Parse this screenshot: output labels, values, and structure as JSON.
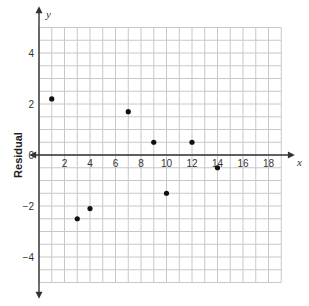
{
  "chart_data": {
    "type": "scatter",
    "title": "",
    "xlabel": "x",
    "ylabel": "Residual",
    "y_axis_letter": "y",
    "xlim": [
      0,
      20
    ],
    "ylim": [
      -5.5,
      5
    ],
    "grid": true,
    "grid_step_x": 1,
    "grid_step_y": 0.5,
    "x_ticks": [
      2,
      4,
      6,
      8,
      10,
      12,
      14,
      16,
      18
    ],
    "y_ticks": [
      4,
      2,
      0,
      -2,
      -4
    ],
    "points": [
      {
        "x": 1,
        "y": 2.2
      },
      {
        "x": 3,
        "y": -2.5
      },
      {
        "x": 4,
        "y": -2.1
      },
      {
        "x": 7,
        "y": 1.7
      },
      {
        "x": 9,
        "y": 0.5
      },
      {
        "x": 10,
        "y": -1.5
      },
      {
        "x": 12,
        "y": 0.5
      },
      {
        "x": 14,
        "y": -0.5
      }
    ],
    "colors": {
      "grid": "#c8c8c8",
      "axis": "#333333",
      "point": "#111111"
    }
  }
}
